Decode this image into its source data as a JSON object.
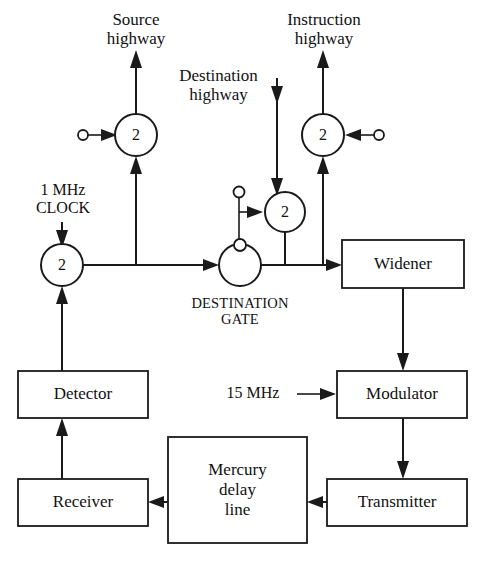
{
  "diagram": {
    "colors": {
      "line": "#1a1a1a",
      "fill": "#ffffff",
      "text": "#111111"
    },
    "labels": {
      "source_highway": "Source\nhighway",
      "instruction_highway": "Instruction\nhighway",
      "destination_highway": "Destination\nhighway",
      "clock": "1 MHz\nCLOCK",
      "destination_gate": "DESTINATION\nGATE",
      "fifteen_mhz": "15 MHz"
    },
    "nodes": [
      {
        "id": "gate-source",
        "label": "2",
        "cx": 136,
        "cy": 135,
        "r": 21
      },
      {
        "id": "gate-instruction",
        "label": "2",
        "cx": 323,
        "cy": 135,
        "r": 21
      },
      {
        "id": "gate-clock",
        "label": "2",
        "cx": 62,
        "cy": 265,
        "r": 21
      },
      {
        "id": "gate-destination-upper",
        "label": "2",
        "cx": 285,
        "cy": 212,
        "r": 20
      },
      {
        "id": "destination-gate-circle",
        "label": "",
        "cx": 240,
        "cy": 265,
        "r": 21
      }
    ],
    "terminals": [
      {
        "id": "source-input-terminal",
        "cx": 83,
        "cy": 135,
        "r": 5
      },
      {
        "id": "instruction-input-terminal",
        "cx": 379,
        "cy": 135,
        "r": 5
      },
      {
        "id": "destination-gate-control-terminal",
        "cx": 239,
        "cy": 192,
        "r": 5.5
      },
      {
        "id": "destination-gate-top-terminal",
        "cx": 240,
        "cy": 245,
        "r": 6
      }
    ],
    "boxes": [
      {
        "id": "widener",
        "label": "Widener",
        "x": 342,
        "y": 240,
        "w": 122,
        "h": 48
      },
      {
        "id": "detector",
        "label": "Detector",
        "x": 18,
        "y": 371,
        "w": 130,
        "h": 47
      },
      {
        "id": "modulator",
        "label": "Modulator",
        "x": 337,
        "y": 371,
        "w": 130,
        "h": 47
      },
      {
        "id": "receiver",
        "label": "Receiver",
        "x": 18,
        "y": 479,
        "w": 130,
        "h": 47
      },
      {
        "id": "mercury-delay-line",
        "label": "Mercury\ndelay\nline",
        "x": 168,
        "y": 437,
        "w": 139,
        "h": 106
      },
      {
        "id": "transmitter",
        "label": "Transmitter",
        "x": 327,
        "y": 479,
        "w": 140,
        "h": 47
      }
    ]
  }
}
